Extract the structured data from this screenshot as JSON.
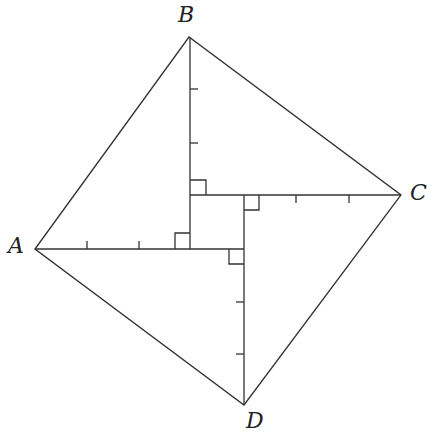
{
  "diagram": {
    "type": "geometry",
    "stroke_color": "#333333",
    "labels": {
      "A": "A",
      "B": "B",
      "C": "C",
      "D": "D"
    },
    "points": {
      "A": [
        35,
        249
      ],
      "B": [
        189,
        37
      ],
      "C": [
        401,
        195
      ],
      "D": [
        244,
        405
      ]
    }
  }
}
